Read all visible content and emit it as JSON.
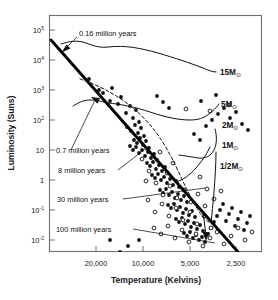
{
  "figure": {
    "background_color": "#ffffff",
    "ink_color": "#111111",
    "frame_color": "#6e6e6e"
  },
  "chart_data": {
    "type": "scatter",
    "title": "",
    "subtitle": "",
    "xlabel": "Temperature (Kelvins)",
    "ylabel": "Luminosity (Suns)",
    "x_scale": "log-reversed",
    "y_scale": "log",
    "grid": false,
    "legend_position": "none",
    "xlim": [
      40000,
      2000
    ],
    "ylim": [
      0.01,
      100000
    ],
    "xticks": [
      20000,
      10000,
      5000,
      2500
    ],
    "xtick_labels": [
      "20,000",
      "10,000",
      "5,000",
      "2,500"
    ],
    "yticks": [
      100000,
      10000,
      1000,
      100,
      10,
      1,
      0.1,
      0.01
    ],
    "ytick_labels": [
      "10⁵",
      "10⁴",
      "10³",
      "10²",
      "10",
      "1",
      "10⁻¹",
      "10⁻²"
    ],
    "ytick_mantissa": [
      "10",
      "10",
      "10",
      "10",
      "10",
      "1",
      "10",
      "10"
    ],
    "ytick_exponent": [
      "5",
      "4",
      "3",
      "2",
      "",
      "",
      "-1",
      "-2"
    ],
    "series": [
      {
        "name": "stellar birthline",
        "style": "thick-solid",
        "description": "Heavy straight line running from upper left to lower right"
      },
      {
        "name": "0.7 million year isochrone",
        "style": "dashed",
        "description": "Dashed curve descending from upper left toward lower right"
      },
      {
        "name": "15M evolutionary track",
        "style": "solid",
        "mass_label": "15M"
      },
      {
        "name": "5M evolutionary track",
        "style": "solid",
        "mass_label": "5M"
      },
      {
        "name": "2M evolutionary track",
        "style": "solid",
        "mass_label": "2M"
      },
      {
        "name": "1M evolutionary track",
        "style": "solid",
        "mass_label": "1M"
      },
      {
        "name": "1/2M evolutionary track",
        "style": "solid",
        "mass_label": "1/2M"
      },
      {
        "name": "observed stars (filled circles)",
        "style": "filled-circle",
        "count": 118
      },
      {
        "name": "observed stars (open circles)",
        "style": "open-circle",
        "count": 46
      }
    ],
    "annotations": [
      {
        "text": "0.16  million years",
        "points_to": "birthline upper left"
      },
      {
        "text": "0.7  million years",
        "points_to": "birthline at 20,000 K"
      },
      {
        "text": "8  million years",
        "points_to": "mid birthline"
      },
      {
        "text": "30  million years",
        "points_to": "lower birthline"
      },
      {
        "text": "100  million years",
        "points_to": "bottom of birthline"
      }
    ]
  },
  "axes": {
    "x_title": "Temperature (Kelvins)",
    "y_title": "Luminosity (Suns)",
    "x_tick_labels": [
      "20,000",
      "10,000",
      "5,000",
      "2,500"
    ],
    "y_tick_labels": [
      {
        "mantissa": "10",
        "exponent": "5"
      },
      {
        "mantissa": "10",
        "exponent": "4"
      },
      {
        "mantissa": "10",
        "exponent": "3"
      },
      {
        "mantissa": "10",
        "exponent": "2"
      },
      {
        "mantissa": "10",
        "exponent": ""
      },
      {
        "mantissa": "1",
        "exponent": ""
      },
      {
        "mantissa": "10",
        "exponent": "-1"
      },
      {
        "mantissa": "10",
        "exponent": "-2"
      }
    ]
  },
  "mass_labels": [
    {
      "id": "m15",
      "text": "15M",
      "sun": "⊙"
    },
    {
      "id": "m5",
      "text": "5M",
      "sun": "⊙"
    },
    {
      "id": "m2",
      "text": "2M",
      "sun": "⊙"
    },
    {
      "id": "m1",
      "text": "1M",
      "sun": "⊙"
    },
    {
      "id": "mhalf",
      "text": "1/2M",
      "sun": "⊙"
    }
  ],
  "age_labels": [
    {
      "id": "age016",
      "text": "0.16  million years"
    },
    {
      "id": "age07",
      "text": "0.7  million years"
    },
    {
      "id": "age8",
      "text": "8  million years"
    },
    {
      "id": "age30",
      "text": "30  million years"
    },
    {
      "id": "age100",
      "text": "100  million years"
    }
  ],
  "scatter": {
    "filled": [
      [
        89,
        79
      ],
      [
        99,
        90
      ],
      [
        103,
        93
      ],
      [
        110,
        101
      ],
      [
        112,
        88
      ],
      [
        118,
        104
      ],
      [
        121,
        97
      ],
      [
        126,
        113
      ],
      [
        130,
        106
      ],
      [
        133,
        118
      ],
      [
        136,
        110
      ],
      [
        139,
        122
      ],
      [
        127,
        127
      ],
      [
        131,
        131
      ],
      [
        135,
        125
      ],
      [
        138,
        133
      ],
      [
        141,
        128
      ],
      [
        144,
        136
      ],
      [
        134,
        140
      ],
      [
        137,
        143
      ],
      [
        140,
        138
      ],
      [
        143,
        145
      ],
      [
        146,
        141
      ],
      [
        149,
        148
      ],
      [
        130,
        146
      ],
      [
        133,
        150
      ],
      [
        136,
        147
      ],
      [
        139,
        153
      ],
      [
        142,
        150
      ],
      [
        145,
        156
      ],
      [
        148,
        152
      ],
      [
        151,
        158
      ],
      [
        154,
        154
      ],
      [
        157,
        160
      ],
      [
        147,
        163
      ],
      [
        150,
        166
      ],
      [
        153,
        162
      ],
      [
        156,
        169
      ],
      [
        159,
        165
      ],
      [
        162,
        171
      ],
      [
        165,
        167
      ],
      [
        168,
        173
      ],
      [
        152,
        175
      ],
      [
        155,
        178
      ],
      [
        158,
        174
      ],
      [
        161,
        180
      ],
      [
        164,
        177
      ],
      [
        167,
        183
      ],
      [
        170,
        179
      ],
      [
        173,
        185
      ],
      [
        176,
        181
      ],
      [
        179,
        187
      ],
      [
        160,
        190
      ],
      [
        163,
        193
      ],
      [
        166,
        189
      ],
      [
        169,
        195
      ],
      [
        172,
        192
      ],
      [
        175,
        198
      ],
      [
        178,
        194
      ],
      [
        181,
        200
      ],
      [
        184,
        196
      ],
      [
        187,
        202
      ],
      [
        168,
        205
      ],
      [
        171,
        208
      ],
      [
        174,
        204
      ],
      [
        177,
        210
      ],
      [
        180,
        207
      ],
      [
        183,
        213
      ],
      [
        186,
        209
      ],
      [
        189,
        215
      ],
      [
        192,
        211
      ],
      [
        195,
        217
      ],
      [
        176,
        219
      ],
      [
        179,
        222
      ],
      [
        182,
        218
      ],
      [
        185,
        224
      ],
      [
        188,
        221
      ],
      [
        191,
        227
      ],
      [
        194,
        223
      ],
      [
        197,
        229
      ],
      [
        200,
        225
      ],
      [
        203,
        231
      ],
      [
        184,
        233
      ],
      [
        187,
        236
      ],
      [
        190,
        232
      ],
      [
        193,
        238
      ],
      [
        196,
        235
      ],
      [
        199,
        240
      ],
      [
        202,
        237
      ],
      [
        205,
        242
      ],
      [
        208,
        234
      ],
      [
        211,
        228
      ],
      [
        214,
        222
      ],
      [
        217,
        216
      ],
      [
        220,
        210
      ],
      [
        223,
        204
      ],
      [
        226,
        221
      ],
      [
        229,
        214
      ],
      [
        232,
        208
      ],
      [
        235,
        226
      ],
      [
        238,
        219
      ],
      [
        241,
        212
      ],
      [
        244,
        230
      ],
      [
        247,
        223
      ],
      [
        250,
        216
      ],
      [
        206,
        126
      ],
      [
        212,
        120
      ],
      [
        218,
        114
      ],
      [
        224,
        108
      ],
      [
        230,
        118
      ],
      [
        236,
        112
      ],
      [
        242,
        124
      ],
      [
        248,
        130
      ],
      [
        194,
        134
      ],
      [
        200,
        140
      ],
      [
        157,
        96
      ],
      [
        163,
        102
      ],
      [
        169,
        108
      ],
      [
        120,
        252
      ],
      [
        128,
        246
      ],
      [
        139,
        240
      ],
      [
        110,
        240
      ],
      [
        201,
        101
      ],
      [
        216,
        95
      ]
    ],
    "open": [
      [
        142,
        159
      ],
      [
        149,
        171
      ],
      [
        156,
        183
      ],
      [
        163,
        195
      ],
      [
        170,
        186
      ],
      [
        177,
        198
      ],
      [
        184,
        190
      ],
      [
        191,
        202
      ],
      [
        198,
        194
      ],
      [
        205,
        206
      ],
      [
        148,
        200
      ],
      [
        155,
        212
      ],
      [
        162,
        204
      ],
      [
        169,
        216
      ],
      [
        176,
        208
      ],
      [
        183,
        220
      ],
      [
        190,
        212
      ],
      [
        197,
        224
      ],
      [
        204,
        216
      ],
      [
        211,
        228
      ],
      [
        154,
        228
      ],
      [
        161,
        234
      ],
      [
        168,
        226
      ],
      [
        175,
        238
      ],
      [
        182,
        230
      ],
      [
        189,
        242
      ],
      [
        196,
        234
      ],
      [
        203,
        246
      ],
      [
        210,
        238
      ],
      [
        217,
        232
      ],
      [
        224,
        244
      ],
      [
        231,
        236
      ],
      [
        238,
        228
      ],
      [
        245,
        240
      ],
      [
        252,
        232
      ],
      [
        186,
        109
      ],
      [
        210,
        111
      ],
      [
        229,
        105
      ],
      [
        167,
        173
      ],
      [
        173,
        163
      ],
      [
        160,
        152
      ],
      [
        146,
        181
      ],
      [
        200,
        177
      ],
      [
        207,
        189
      ],
      [
        214,
        199
      ],
      [
        221,
        191
      ]
    ]
  }
}
